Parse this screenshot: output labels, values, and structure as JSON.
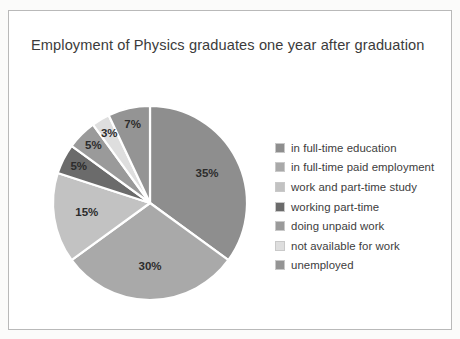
{
  "panel": {
    "background_color": "#ffffff",
    "border_color": "#b9b9b9",
    "page_background": "#fbfbfa"
  },
  "chart_data": {
    "type": "pie",
    "title": "Employment of Physics graduates one year after graduation",
    "xlabel": "",
    "ylabel": "",
    "legend_position": "right",
    "grid": false,
    "start_angle_deg": 0,
    "direction": "clockwise",
    "unit": "%",
    "categories": [
      "in full-time education",
      "in full-time paid employment",
      "work and part-time study",
      "working part-time",
      "doing unpaid work",
      "not available for work",
      "unemployed"
    ],
    "values": [
      35,
      30,
      15,
      5,
      5,
      3,
      7
    ],
    "value_labels": [
      "35%",
      "30%",
      "15%",
      "5%",
      "5%",
      "3%",
      "7%"
    ],
    "colors": [
      "#8e8e8e",
      "#a9a9a9",
      "#c2c2c2",
      "#6b6b6b",
      "#9a9a9a",
      "#dedede",
      "#949494"
    ],
    "slice_label_color": "#2c2c2c",
    "slice_separator_color": "#ffffff"
  },
  "legend": {
    "items": [
      {
        "label": "in full-time education",
        "color": "#8e8e8e"
      },
      {
        "label": "in full-time paid employment",
        "color": "#a9a9a9"
      },
      {
        "label": "work and part-time study",
        "color": "#c2c2c2"
      },
      {
        "label": "working part-time",
        "color": "#6b6b6b"
      },
      {
        "label": "doing unpaid work",
        "color": "#9a9a9a"
      },
      {
        "label": "not available for work",
        "color": "#dedede"
      },
      {
        "label": "unemployed",
        "color": "#949494"
      }
    ]
  }
}
